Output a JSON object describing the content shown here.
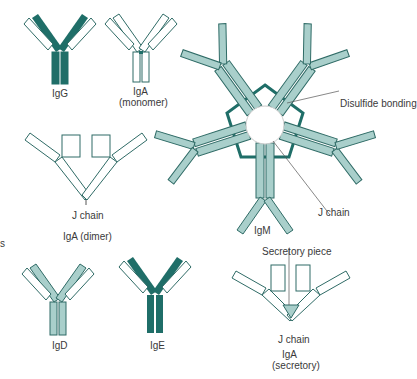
{
  "colors": {
    "dark": "#1f6e68",
    "light": "#a9cfcb",
    "outline": "#2f6b66",
    "line": "#555555"
  },
  "labels": {
    "igg": "IgG",
    "iga_mono": "IgA",
    "iga_mono_sub": "(monomer)",
    "disulfide": "Disulfide bonding",
    "jchain_igm": "J chain",
    "igm": "IgM",
    "jchain_dimer": "J chain",
    "iga_dimer": "IgA (dimer)",
    "igd": "IgD",
    "ige": "IgE",
    "secretory_piece": "Secretory piece",
    "jchain_sec": "J chain",
    "iga_sec": "IgA",
    "iga_sec_sub": "(secretory)",
    "edge_letter": "s"
  }
}
